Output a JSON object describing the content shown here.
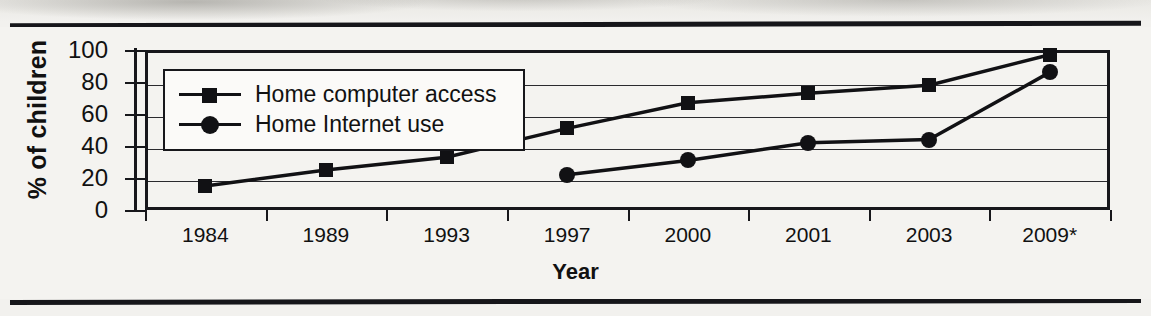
{
  "chart_data": {
    "type": "line",
    "title": "",
    "xlabel": "Year",
    "ylabel": "% of children",
    "categories": [
      "1984",
      "1989",
      "1993",
      "1997",
      "2000",
      "2001",
      "2003",
      "2009*"
    ],
    "ylim": [
      0,
      100
    ],
    "yticks": [
      "0",
      "20",
      "40",
      "60",
      "80",
      "100"
    ],
    "grid": true,
    "legend_position": "upper-left-inside",
    "series": [
      {
        "name": "Home computer access",
        "marker": "square",
        "values": [
          15,
          25,
          33,
          51,
          67,
          73,
          78,
          97
        ]
      },
      {
        "name": "Home Internet use",
        "marker": "circle",
        "values": [
          null,
          null,
          null,
          22,
          31,
          42,
          44,
          86
        ]
      }
    ]
  },
  "legend": {
    "items": [
      {
        "label": "Home computer access",
        "marker": "square-marker-icon"
      },
      {
        "label": "Home Internet use",
        "marker": "circle-marker-icon"
      }
    ]
  },
  "colors": {
    "ink": "#111114",
    "paper": "#f4f3f0",
    "grid": "#2a2a2e"
  }
}
